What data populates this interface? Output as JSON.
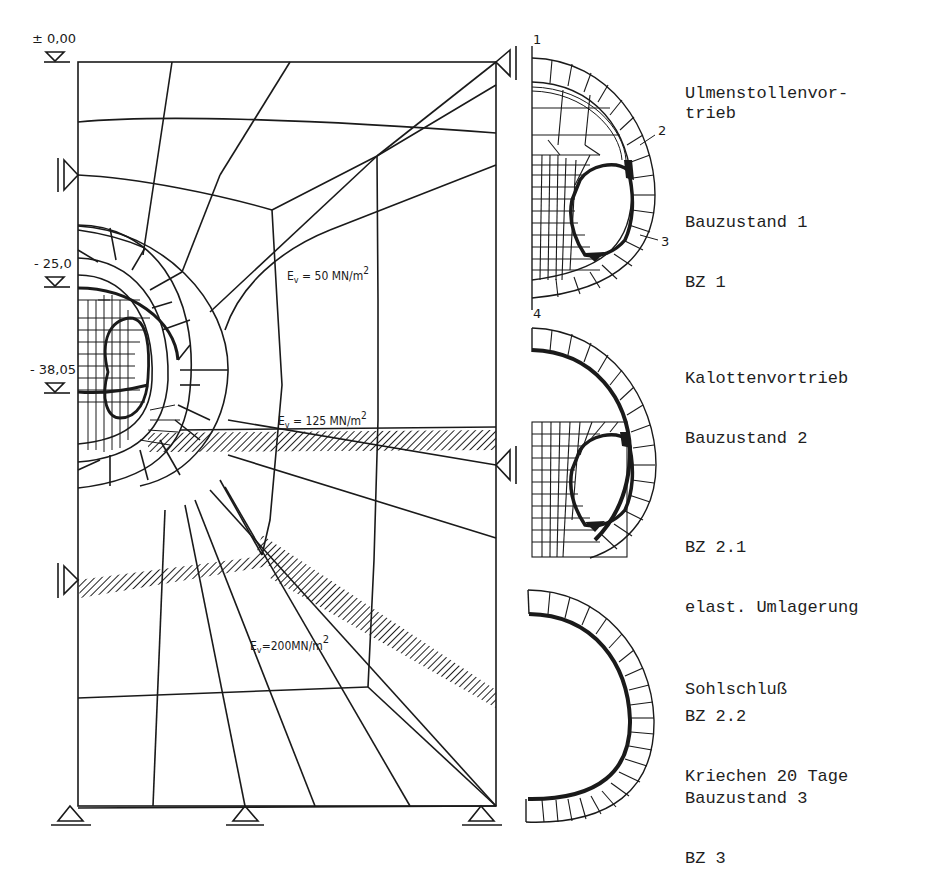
{
  "elevations": [
    {
      "label": "± 0,00",
      "y": 62
    },
    {
      "label": "- 25,0",
      "y": 287
    },
    {
      "label": "- 38,05",
      "y": 393
    }
  ],
  "materials": [
    {
      "label": "Ev = 50 MN/m²",
      "E": "E",
      "sub": "v",
      "text": " = 50 MN/m",
      "sup": "2"
    },
    {
      "label": "Ev = 125 MN/m²",
      "E": "E",
      "sub": "v",
      "text": " = 125 MN/m",
      "sup": "2"
    },
    {
      "label": "Ev=200MN/m²",
      "E": "E",
      "sub": "v",
      "text": "=200MN/m",
      "sup": "2"
    }
  ],
  "section_markers": [
    "1",
    "2",
    "3",
    "4"
  ],
  "stages": [
    {
      "title": "Ulmenstollenvor-\ntrieb",
      "stage": "Bauzustand 1",
      "code": "BZ 1"
    },
    {
      "title": "Kalottenvortrieb",
      "stage": "Bauzustand 2",
      "sub1_code": "BZ 2.1",
      "sub1_desc": "elast. Umlagerung",
      "sub2_code": "BZ 2.2",
      "sub2_desc": "Kriechen 20 Tage"
    },
    {
      "title": "Sohlschluß",
      "stage": "Bauzustand 3",
      "code": "BZ 3"
    }
  ],
  "colors": {
    "ink": "#1a1a1a",
    "paper": "#ffffff"
  }
}
